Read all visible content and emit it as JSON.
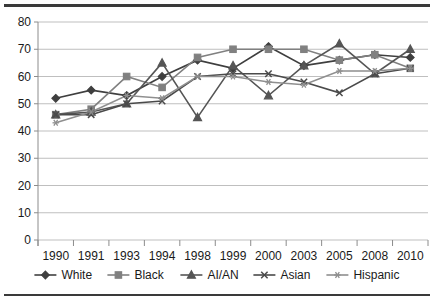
{
  "chart_data": {
    "type": "line",
    "title": "",
    "subtitle": "",
    "xlabel": "",
    "ylabel": "",
    "categories": [
      "1990",
      "1991",
      "1993",
      "1994",
      "1998",
      "1999",
      "2000",
      "2003",
      "2005",
      "2008",
      "2010"
    ],
    "ylim": [
      0,
      80
    ],
    "ytick_step": 10,
    "yticks": [
      "0",
      "10",
      "20",
      "30",
      "40",
      "50",
      "60",
      "70",
      "80"
    ],
    "grid": "horizontal",
    "legend_position": "bottom",
    "series": [
      {
        "name": "White",
        "marker": "diamond",
        "color": "#3f3f3f",
        "values": [
          52,
          55,
          53,
          60,
          66,
          63,
          71,
          64,
          66,
          68,
          67
        ]
      },
      {
        "name": "Black",
        "marker": "square",
        "color": "#808080",
        "values": [
          46,
          48,
          60,
          56,
          67,
          70,
          70,
          70,
          66,
          68,
          63
        ]
      },
      {
        "name": "AI/AN",
        "marker": "triangle",
        "color": "#555555",
        "values": [
          46,
          47,
          50,
          65,
          45,
          64,
          53,
          64,
          72,
          61,
          70
        ]
      },
      {
        "name": "Asian",
        "marker": "cross",
        "color": "#4a4a4a",
        "values": [
          46,
          46,
          50,
          51,
          60,
          61,
          61,
          58,
          54,
          61,
          63
        ]
      },
      {
        "name": "Hispanic",
        "marker": "asterisk",
        "color": "#8f8f8f",
        "values": [
          43,
          47,
          53,
          52,
          60,
          60,
          58,
          57,
          62,
          62,
          63
        ]
      }
    ]
  },
  "legend": {
    "items": [
      {
        "label": "White"
      },
      {
        "label": "Black"
      },
      {
        "label": "AI/AN"
      },
      {
        "label": "Asian"
      },
      {
        "label": "Hispanic"
      }
    ]
  }
}
